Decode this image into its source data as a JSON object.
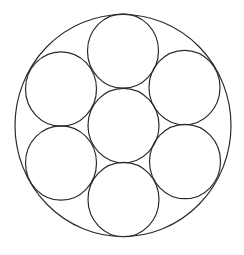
{
  "diagram": {
    "type": "circle-packing",
    "stroke_color": "#2a2a2a",
    "background": "#ffffff",
    "outer": {
      "cx": 123,
      "cy": 125.5,
      "rx": 108,
      "ry": 111
    },
    "inner": [
      {
        "id": "center",
        "cx": 123.5,
        "cy": 125.5,
        "rx": 35.5,
        "ry": 37.2
      },
      {
        "id": "top",
        "cx": 123,
        "cy": 51,
        "rx": 35.5,
        "ry": 37.2
      },
      {
        "id": "bottom",
        "cx": 123.5,
        "cy": 199.5,
        "rx": 35.5,
        "ry": 37.2
      },
      {
        "id": "upper-left",
        "cx": 61,
        "cy": 89,
        "rx": 35.5,
        "ry": 37.2
      },
      {
        "id": "upper-right",
        "cx": 184.5,
        "cy": 87.5,
        "rx": 35.5,
        "ry": 37.2
      },
      {
        "id": "lower-left",
        "cx": 61,
        "cy": 163,
        "rx": 35.5,
        "ry": 37.2
      },
      {
        "id": "lower-right",
        "cx": 185,
        "cy": 161.5,
        "rx": 35.5,
        "ry": 37.2
      }
    ]
  }
}
